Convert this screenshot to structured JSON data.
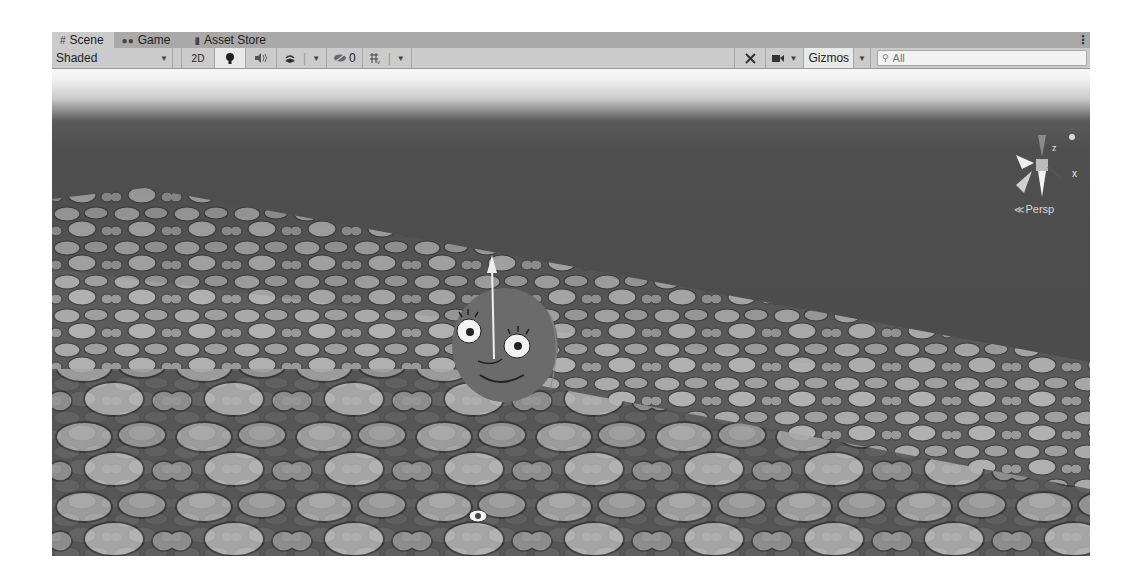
{
  "tabs": [
    {
      "label": "Scene",
      "icon": "grid-icon",
      "active": true
    },
    {
      "label": "Game",
      "icon": "gamepad-icon",
      "active": false
    },
    {
      "label": "Asset Store",
      "icon": "shopping-bag-icon",
      "active": false
    }
  ],
  "toolbar": {
    "draw_mode": "Shaded",
    "mode_2d": "2D",
    "lighting_icon": "lightbulb-icon",
    "audio_icon": "speaker-icon",
    "effects_icon": "effects-layers-icon",
    "hidden_count": "0",
    "grid_icon": "grid-snap-icon",
    "tools_icon": "tools-icon",
    "camera_icon": "camera-icon",
    "gizmos_label": "Gizmos",
    "search_placeholder": "All"
  },
  "scene": {
    "projection_label": "Persp",
    "axis_labels": {
      "x": "x",
      "z": "z"
    },
    "colors": {
      "sky_top": "#f5f5f5",
      "horizon": "#4f4f4f",
      "ground": "#8e8e8e",
      "stone": "#a8a8a8",
      "character": "#6a6a6a"
    }
  }
}
